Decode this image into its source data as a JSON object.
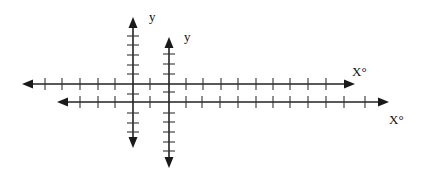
{
  "diagram": {
    "colors": {
      "ink": "#222222",
      "background": "#ffffff"
    },
    "system_a": {
      "x_axis": {
        "label": "X°",
        "y": 84,
        "x_start": 22,
        "x_end": 355,
        "ticks": [
          45,
          62,
          80,
          98,
          115,
          150,
          186,
          203,
          221,
          238,
          256,
          273,
          290,
          308,
          326
        ]
      },
      "y_axis": {
        "label": "y",
        "x": 133,
        "y_start": 17,
        "y_end": 148,
        "ticks": [
          36,
          45,
          55,
          65,
          74,
          94,
          113,
          123,
          132
        ]
      }
    },
    "system_b": {
      "x_axis": {
        "label": "X°",
        "y": 102,
        "x_start": 57,
        "x_end": 389,
        "ticks": [
          80,
          98,
          115,
          150,
          186,
          202,
          220,
          238,
          256,
          273,
          290,
          308,
          326,
          344,
          365
        ]
      },
      "y_axis": {
        "label": "y",
        "x": 169,
        "y_start": 37,
        "y_end": 168,
        "ticks": [
          54,
          64,
          74,
          92,
          113,
          122,
          132,
          142,
          151
        ]
      }
    }
  }
}
